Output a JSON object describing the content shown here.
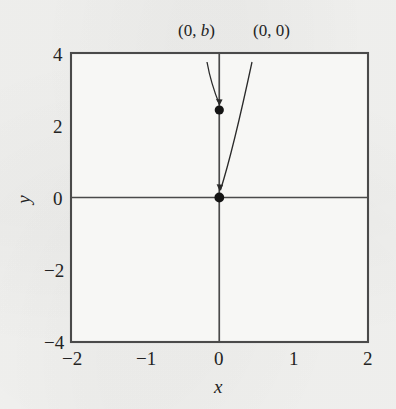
{
  "figure": {
    "kind": "slope-field-phase-portrait",
    "background_color": "#f3f3f1",
    "plot_fill_color": "#f7f7f5",
    "frame_color": "#4a4a4a",
    "solution_curve_color": "#5a5a5a",
    "slope_mark_color": "#7a7a7a",
    "point_color": "#141414",
    "label_color": "#232323"
  },
  "axes": {
    "x": {
      "label": "x",
      "min": -2,
      "max": 2,
      "ticks": [
        -2,
        -1,
        0,
        1,
        2
      ],
      "tick_labels": [
        "−2",
        "−1",
        "0",
        "1",
        "2"
      ]
    },
    "y": {
      "label": "y",
      "min": -4,
      "max": 4,
      "ticks": [
        -4,
        -2,
        0,
        2,
        4
      ],
      "tick_labels": [
        "−4",
        "−2",
        "0",
        "2",
        "4"
      ]
    },
    "grid": false
  },
  "annotations": [
    {
      "name": "point-0-b",
      "text_prefix": "(0, ",
      "text_var": "b",
      "text_suffix": ")",
      "full_text": "(0, b)",
      "point": [
        0,
        2.6
      ],
      "label_pos": [
        -0.22,
        4.85
      ]
    },
    {
      "name": "point-0-0",
      "text_prefix": "(0, ",
      "text_var": "0",
      "text_suffix": ")",
      "full_text": "(0, 0)",
      "point": [
        0,
        0
      ],
      "label_pos": [
        0.78,
        4.85
      ]
    }
  ],
  "chart_data": {
    "type": "line",
    "title": "",
    "xlabel": "x",
    "ylabel": "y",
    "xlim": [
      -2,
      2
    ],
    "ylim": [
      -4,
      4
    ],
    "grid": false,
    "legend": null,
    "slope_field": {
      "equation": "dy/dx = 2y/x",
      "x_samples": [
        -1.875,
        -1.625,
        -1.375,
        -1.125,
        -0.875,
        -0.625,
        -0.375,
        -0.125,
        0.125,
        0.375,
        0.625,
        0.875,
        1.125,
        1.375,
        1.625,
        1.875
      ],
      "y_samples": [
        -3.75,
        -3.25,
        -2.75,
        -2.25,
        -1.75,
        -1.25,
        -0.75,
        -0.25,
        0.25,
        0.75,
        1.25,
        1.75,
        2.25,
        2.75,
        3.25,
        3.75
      ],
      "mark_length_px": 13,
      "style": "dashed"
    },
    "solution_curves": {
      "family": "y = C x^2",
      "C_values": [
        -8,
        -4.5,
        -2.6,
        -1.5,
        -0.85,
        -0.45,
        -0.2,
        -0.07,
        0.07,
        0.2,
        0.45,
        0.85,
        1.5,
        2.6,
        4.5,
        8
      ],
      "vertical_axis_curve": "x = 0 (the y-axis itself is a solution ray pair)"
    },
    "points": [
      {
        "label": "(0, b)",
        "x": 0,
        "y": 2.6
      },
      {
        "label": "(0, 0)",
        "x": 0,
        "y": 0
      }
    ]
  }
}
